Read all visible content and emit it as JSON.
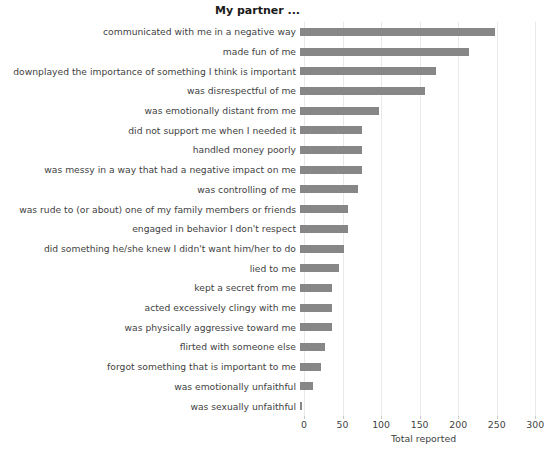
{
  "chart_data": {
    "type": "bar",
    "orientation": "horizontal",
    "title": "My partner ...",
    "xlabel": "Total reported",
    "ylabel": "",
    "xlim": [
      0,
      310
    ],
    "xticks": [
      0,
      50,
      100,
      150,
      200,
      250,
      300
    ],
    "grid": "vertical",
    "legend": "none",
    "bar_color": "#878787",
    "categories": [
      "communicated with me in a negative way",
      "made fun of me",
      "downplayed the importance of something I think is important",
      "was disrespectful of me",
      "was emotionally distant from me",
      "did not support me when I needed it",
      "handled money poorly",
      "was messy in a way that had a negative impact on me",
      "was controlling of me",
      "was rude to (or about) one of my family members or friends",
      "engaged in behavior I don't respect",
      "did something he/she knew I didn't want him/her to do",
      "lied to me",
      "kept a secret from me",
      "acted excessively clingy with me",
      "was physically aggressive toward me",
      "flirted with someone else",
      "forgot something that is important to me",
      "was emotionally unfaithful",
      "was sexually unfaithful"
    ],
    "values": [
      253,
      219,
      176,
      162,
      103,
      80,
      80,
      80,
      75,
      62,
      62,
      57,
      50,
      42,
      42,
      42,
      33,
      27,
      17,
      2
    ]
  }
}
